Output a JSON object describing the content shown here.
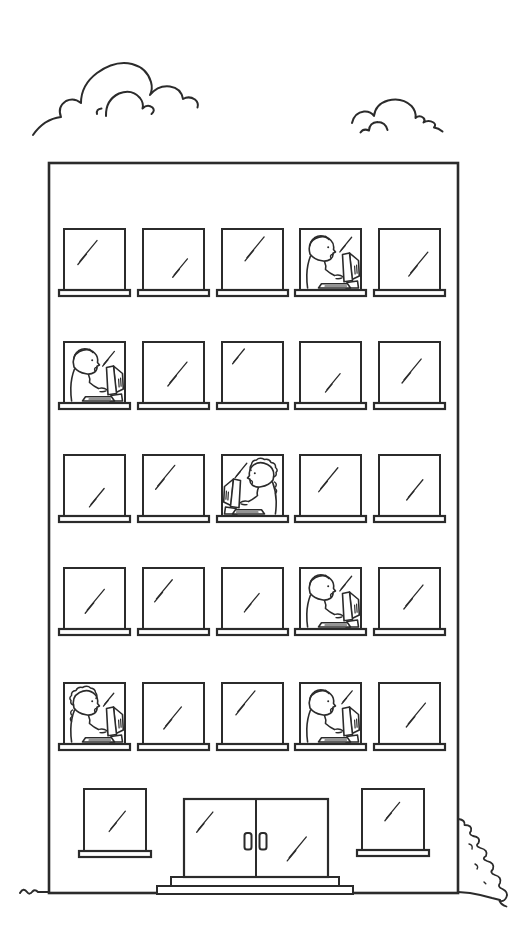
{
  "illustration": {
    "title": "Line-art drawing of a five-story office building with people working at computers in the windows",
    "background_color": "#ffffff",
    "ink_color": "#2b2b2b",
    "clouds": {
      "left": {
        "x": 33,
        "y": 58,
        "width": 190,
        "height": 78
      },
      "right": {
        "x": 350,
        "y": 97,
        "width": 95,
        "height": 36
      }
    },
    "ground": {
      "line_y": 892,
      "left_end_x": 20,
      "right_end_x": 500
    },
    "bush": {
      "position": "bottom-right-of-building",
      "x": 458,
      "y": 818,
      "width": 46,
      "height": 80
    },
    "building": {
      "x": 49,
      "y": 163,
      "width": 409,
      "height": 730,
      "floors": 5,
      "windows_per_floor": 5,
      "window_columns_x": [
        64,
        143,
        222,
        300,
        379
      ],
      "window_row_y": [
        229,
        342,
        455,
        568,
        683
      ],
      "window_width": 61,
      "window_height": 61,
      "sill": {
        "overhang": 5,
        "height": 6
      },
      "windows": [
        [
          {
            "occupant": null,
            "shine": {
              "x": 0.4,
              "y": 0.36,
              "len": 26
            }
          },
          {
            "occupant": null,
            "shine": {
              "x": 0.62,
              "y": 0.62,
              "len": 20
            }
          },
          {
            "occupant": null,
            "shine": {
              "x": 0.55,
              "y": 0.3,
              "len": 26
            }
          },
          {
            "occupant": {
              "facing": "right",
              "hair": "short"
            },
            "shine": {
              "x": 0.76,
              "y": 0.24,
              "len": 16
            }
          },
          {
            "occupant": null,
            "shine": {
              "x": 0.66,
              "y": 0.55,
              "len": 26
            }
          }
        ],
        [
          {
            "occupant": {
              "facing": "right",
              "hair": "short"
            },
            "shine": {
              "x": 0.74,
              "y": 0.26,
              "len": 16
            }
          },
          {
            "occupant": null,
            "shine": {
              "x": 0.58,
              "y": 0.5,
              "len": 26
            }
          },
          {
            "occupant": null,
            "shine": {
              "x": 0.28,
              "y": 0.22,
              "len": 16
            }
          },
          {
            "occupant": null,
            "shine": {
              "x": 0.55,
              "y": 0.65,
              "len": 20
            }
          },
          {
            "occupant": null,
            "shine": {
              "x": 0.55,
              "y": 0.45,
              "len": 26
            }
          }
        ],
        [
          {
            "occupant": null,
            "shine": {
              "x": 0.55,
              "y": 0.68,
              "len": 20
            }
          },
          {
            "occupant": null,
            "shine": {
              "x": 0.38,
              "y": 0.34,
              "len": 26
            }
          },
          {
            "occupant": {
              "facing": "left",
              "hair": "curly"
            },
            "shine": {
              "x": 0.32,
              "y": 0.24,
              "len": 16
            }
          },
          {
            "occupant": null,
            "shine": {
              "x": 0.48,
              "y": 0.38,
              "len": 26
            }
          },
          {
            "occupant": null,
            "shine": {
              "x": 0.6,
              "y": 0.55,
              "len": 22
            }
          }
        ],
        [
          {
            "occupant": null,
            "shine": {
              "x": 0.52,
              "y": 0.52,
              "len": 26
            }
          },
          {
            "occupant": null,
            "shine": {
              "x": 0.35,
              "y": 0.35,
              "len": 24
            }
          },
          {
            "occupant": null,
            "shine": {
              "x": 0.5,
              "y": 0.55,
              "len": 20
            }
          },
          {
            "occupant": {
              "facing": "right",
              "hair": "short"
            },
            "shine": {
              "x": 0.76,
              "y": 0.24,
              "len": 16
            }
          },
          {
            "occupant": null,
            "shine": {
              "x": 0.58,
              "y": 0.45,
              "len": 26
            }
          }
        ],
        [
          {
            "occupant": {
              "facing": "right",
              "hair": "curly"
            },
            "shine": {
              "x": 0.74,
              "y": 0.26,
              "len": 14
            }
          },
          {
            "occupant": null,
            "shine": {
              "x": 0.5,
              "y": 0.55,
              "len": 24
            }
          },
          {
            "occupant": null,
            "shine": {
              "x": 0.4,
              "y": 0.3,
              "len": 26
            }
          },
          {
            "occupant": {
              "facing": "right",
              "hair": "short"
            },
            "shine": {
              "x": 0.78,
              "y": 0.22,
              "len": 14
            }
          },
          {
            "occupant": null,
            "shine": {
              "x": 0.62,
              "y": 0.5,
              "len": 26
            }
          }
        ]
      ],
      "ground_floor": {
        "left_window": {
          "x": 84,
          "y": 789,
          "width": 62,
          "height": 62,
          "shine": {
            "x": 0.55,
            "y": 0.5,
            "len": 22
          }
        },
        "right_window": {
          "x": 362,
          "y": 789,
          "width": 62,
          "height": 61,
          "shine": {
            "x": 0.5,
            "y": 0.35,
            "len": 20
          }
        },
        "door": {
          "x": 184,
          "y": 799,
          "width": 144,
          "height": 78,
          "leaves": 2,
          "handle_count": 2,
          "left_shine": {
            "x": 0.3,
            "y": 0.28,
            "len": 22
          },
          "right_shine": {
            "x": 0.58,
            "y": 0.62,
            "len": 26
          }
        },
        "steps": [
          {
            "x": 171,
            "y": 877,
            "width": 168,
            "height": 9
          },
          {
            "x": 157,
            "y": 886,
            "width": 196,
            "height": 8
          }
        ]
      }
    },
    "people": {
      "count": 6,
      "locations": [
        {
          "floor_from_top": 1,
          "window": 4,
          "facing": "right",
          "hair": "short"
        },
        {
          "floor_from_top": 2,
          "window": 1,
          "facing": "right",
          "hair": "short"
        },
        {
          "floor_from_top": 3,
          "window": 3,
          "facing": "left",
          "hair": "curly"
        },
        {
          "floor_from_top": 4,
          "window": 4,
          "facing": "right",
          "hair": "short"
        },
        {
          "floor_from_top": 5,
          "window": 1,
          "facing": "right",
          "hair": "curly"
        },
        {
          "floor_from_top": 5,
          "window": 4,
          "facing": "right",
          "hair": "short"
        }
      ]
    }
  }
}
